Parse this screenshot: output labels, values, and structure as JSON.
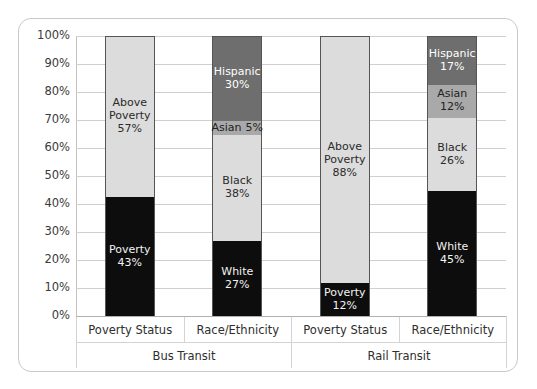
{
  "chart_data": {
    "type": "bar",
    "subtype": "stacked-bar-100pct",
    "title": "",
    "xlabel": "",
    "ylabel": "",
    "ylim": [
      0,
      100
    ],
    "grid": true,
    "legend": "none",
    "y_ticks": [
      "0%",
      "10%",
      "20%",
      "30%",
      "40%",
      "50%",
      "60%",
      "70%",
      "80%",
      "90%",
      "100%"
    ],
    "groups": [
      {
        "label": "Bus Transit"
      },
      {
        "label": "Rail Transit"
      }
    ],
    "categories": [
      "Poverty Status",
      "Race/Ethnicity",
      "Poverty Status",
      "Race/Ethnicity"
    ],
    "bars": [
      {
        "group": "Bus Transit",
        "category": "Poverty Status",
        "segments": [
          {
            "label": "Poverty",
            "value": 43,
            "value_text": "43%",
            "fill": "dark"
          },
          {
            "label": "Above Poverty",
            "value": 57,
            "value_text": "57%",
            "fill": "light"
          }
        ]
      },
      {
        "group": "Bus Transit",
        "category": "Race/Ethnicity",
        "segments": [
          {
            "label": "White",
            "value": 27,
            "value_text": "27%",
            "fill": "dark"
          },
          {
            "label": "Black",
            "value": 38,
            "value_text": "38%",
            "fill": "light"
          },
          {
            "label": "Asian",
            "value": 5,
            "value_text": "5%",
            "fill": "mid"
          },
          {
            "label": "Hispanic",
            "value": 30,
            "value_text": "30%",
            "fill": "darkgray"
          }
        ]
      },
      {
        "group": "Rail Transit",
        "category": "Poverty Status",
        "segments": [
          {
            "label": "Poverty",
            "value": 12,
            "value_text": "12%",
            "fill": "dark"
          },
          {
            "label": "Above Poverty",
            "value": 88,
            "value_text": "88%",
            "fill": "light"
          }
        ]
      },
      {
        "group": "Rail Transit",
        "category": "Race/Ethnicity",
        "segments": [
          {
            "label": "White",
            "value": 45,
            "value_text": "45%",
            "fill": "dark"
          },
          {
            "label": "Black",
            "value": 26,
            "value_text": "26%",
            "fill": "light"
          },
          {
            "label": "Asian",
            "value": 12,
            "value_text": "12%",
            "fill": "mid"
          },
          {
            "label": "Hispanic",
            "value": 17,
            "value_text": "17%",
            "fill": "darkgray"
          }
        ]
      }
    ],
    "colors": {
      "dark": "#0d0d0d",
      "light": "#dcdcdc",
      "mid": "#a9a9a9",
      "darkgray": "#6e6e6e",
      "gridline": "#cfcfcf",
      "border": "#c9c9c9"
    }
  }
}
